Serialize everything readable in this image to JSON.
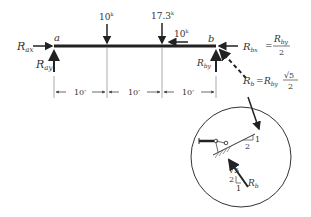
{
  "beam": {
    "point_a": "a",
    "point_b": "b",
    "loads": [
      {
        "label": "10",
        "unit": "k",
        "direction": "down"
      },
      {
        "label": "17.3",
        "unit": "k",
        "direction": "down"
      },
      {
        "label": "10",
        "unit": "k",
        "direction": "left"
      }
    ],
    "spans": [
      "10′",
      "10′",
      "10′"
    ]
  },
  "reactions": {
    "rax": {
      "main": "R",
      "sub": "ax"
    },
    "ray": {
      "main": "R",
      "sub": "ay"
    },
    "rby": {
      "main": "R",
      "sub": "by"
    },
    "rbx_eq": {
      "lhs_main": "R",
      "lhs_sub": "bx",
      "eq": "=",
      "num_main": "R",
      "num_sub": "by",
      "den": "2"
    },
    "rb_eq": {
      "lhs_main": "R",
      "lhs_sub": "b",
      "eq": "=",
      "rhs_main": "R",
      "rhs_sub": "by",
      "num": "√5",
      "den": "2"
    }
  },
  "detail": {
    "slope_top": {
      "rise": "1",
      "run": "2"
    },
    "slope_force": {
      "rise": "2",
      "run": "1",
      "hyp": "√5"
    },
    "force_label": {
      "main": "R",
      "sub": "b"
    }
  },
  "colors": {
    "line": "#222222",
    "dim": "#555555"
  }
}
